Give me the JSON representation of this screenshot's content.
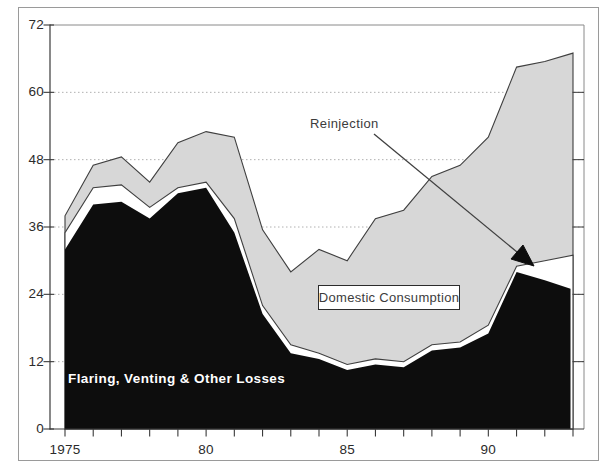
{
  "figure": {
    "labels": {
      "reinjection": "Reinjection",
      "domestic_consumption": "Domestic Consumption",
      "flaring": "Flaring, Venting & Other Losses"
    },
    "colors": {
      "flaring_fill": "#0d0d0d",
      "reinjection_fill": "#ffffff",
      "domestic_fill": "#d7d7d7",
      "outline": "#3f3f3f",
      "grid": "#b0b0b0",
      "axis": "#3a3a3a",
      "frame": "#8a8a8a",
      "arrow": "#3f3f3f"
    }
  },
  "chart_data": {
    "type": "area",
    "stacked": true,
    "title": "",
    "xlabel": "",
    "ylabel": "",
    "x": [
      1975,
      1976,
      1977,
      1978,
      1979,
      1980,
      1981,
      1982,
      1983,
      1984,
      1985,
      1986,
      1987,
      1988,
      1989,
      1990,
      1991,
      1992,
      1993
    ],
    "series": [
      {
        "name": "Flaring, Venting & Other Losses",
        "color": "#0d0d0d",
        "values": [
          32,
          40,
          40.5,
          37.5,
          42,
          43,
          35,
          20.5,
          13.5,
          12.5,
          10.5,
          11.5,
          11,
          14,
          14.5,
          17,
          28,
          26.5,
          25
        ]
      },
      {
        "name": "Reinjection",
        "color": "#ffffff",
        "values": [
          3,
          3,
          3,
          2,
          1,
          1,
          2.5,
          1.5,
          1.5,
          1,
          1,
          1,
          1,
          1,
          1,
          1.5,
          1,
          3.5,
          6
        ]
      },
      {
        "name": "Domestic Consumption",
        "color": "#d7d7d7",
        "values": [
          3,
          4,
          5,
          4.5,
          8,
          9,
          14.5,
          13.5,
          13,
          18.5,
          18.5,
          25,
          27,
          30,
          31.5,
          33.5,
          35.5,
          35.5,
          36
        ]
      }
    ],
    "ylim": [
      0,
      72
    ],
    "yticks": [
      0,
      12,
      24,
      36,
      48,
      60,
      72
    ],
    "xtick_labels": [
      {
        "x": 1975,
        "label": "1975"
      },
      {
        "x": 1980,
        "label": "80"
      },
      {
        "x": 1985,
        "label": "85"
      },
      {
        "x": 1990,
        "label": "90"
      }
    ],
    "xticks_minor_every_year": true,
    "grid": "horizontal-dotted",
    "legend_position": "none",
    "annotations": [
      {
        "text": "Reinjection",
        "type": "arrow-label",
        "points_to_series": "Reinjection",
        "arrow_tip_x": 1991.6,
        "arrow_tip_y": 29
      },
      {
        "text": "Domestic Consumption",
        "type": "boxed-label",
        "labels_series": "Domestic Consumption"
      },
      {
        "text": "Flaring, Venting & Other Losses",
        "type": "inline-label",
        "labels_series": "Flaring, Venting & Other Losses"
      }
    ]
  }
}
